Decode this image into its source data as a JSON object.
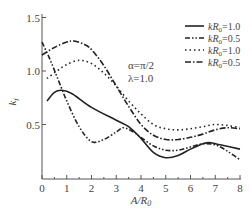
{
  "chart_data": {
    "type": "line",
    "title": "",
    "xlabel": "A/R0",
    "ylabel": "k_f^2",
    "xlim": [
      0,
      8
    ],
    "ylim": [
      0,
      1.5
    ],
    "x_ticks": [
      0,
      1,
      2,
      3,
      4,
      5,
      6,
      7,
      8
    ],
    "y_ticks": [
      0.5,
      1.0,
      1.5
    ],
    "y_tick_labels": [
      "0.5",
      "1.0",
      "1.5"
    ],
    "grid": false,
    "legend_position": "upper right",
    "annotations": [
      "α=π/2",
      "λ=1.0"
    ],
    "series": [
      {
        "name": "kR0=1.0",
        "style": "solid",
        "x": [
          0.2,
          0.5,
          0.8,
          1.2,
          2.0,
          3.0,
          3.5,
          4.0,
          4.5,
          5.0,
          5.5,
          6.0,
          6.5,
          6.8,
          7.2,
          8.0
        ],
        "y": [
          0.72,
          0.8,
          0.82,
          0.79,
          0.66,
          0.54,
          0.48,
          0.37,
          0.24,
          0.19,
          0.21,
          0.27,
          0.32,
          0.33,
          0.31,
          0.27
        ]
      },
      {
        "name": "kR0=0.5",
        "style": "dash-dot-dot",
        "x": [
          0.0,
          0.3,
          0.6,
          1.0,
          1.5,
          2.0,
          2.5,
          3.0,
          3.3,
          3.7,
          4.0,
          4.5,
          5.0,
          5.5,
          6.0,
          6.5,
          7.0,
          7.5,
          8.0
        ],
        "y": [
          1.27,
          1.12,
          0.95,
          0.72,
          0.48,
          0.34,
          0.36,
          0.43,
          0.47,
          0.43,
          0.38,
          0.3,
          0.26,
          0.26,
          0.29,
          0.32,
          0.31,
          0.25,
          0.17
        ]
      },
      {
        "name": "kR0=1.0",
        "style": "dotted",
        "x": [
          0.2,
          0.6,
          1.0,
          1.5,
          2.0,
          2.5,
          3.0,
          3.5,
          4.0,
          4.5,
          5.0,
          5.5,
          6.0,
          6.5,
          7.0,
          7.5,
          8.0
        ],
        "y": [
          0.93,
          1.0,
          1.06,
          1.1,
          1.07,
          0.98,
          0.86,
          0.72,
          0.6,
          0.5,
          0.46,
          0.45,
          0.46,
          0.48,
          0.5,
          0.49,
          0.47
        ]
      },
      {
        "name": "kR0=0.5",
        "style": "dash-dot",
        "x": [
          0.0,
          0.5,
          1.0,
          1.3,
          1.7,
          2.0,
          2.5,
          3.0,
          3.5,
          4.0,
          4.5,
          5.0,
          5.5,
          6.0,
          6.5,
          7.0,
          7.5,
          8.0
        ],
        "y": [
          1.15,
          1.22,
          1.27,
          1.28,
          1.25,
          1.2,
          1.05,
          0.86,
          0.67,
          0.5,
          0.4,
          0.36,
          0.36,
          0.38,
          0.41,
          0.45,
          0.47,
          0.46
        ]
      }
    ]
  },
  "legend": [
    {
      "label": "kR0=1.0",
      "style": "solid"
    },
    {
      "label": "kR0=0.5",
      "style": "dash-dot-dot"
    },
    {
      "label": "kR0=1.0",
      "style": "dotted"
    },
    {
      "label": "kR0=0.5",
      "style": "dash-dot"
    }
  ],
  "annotation": {
    "alpha": "α=π/2",
    "lambda": "λ=1.0"
  },
  "axes": {
    "xlabel": "A/R",
    "xlabel_sub": "0",
    "ylabel": "k",
    "ylabel_sub": "f",
    "ylabel_sup": "2"
  },
  "colors": {
    "line": "#222222",
    "axis": "#555555"
  }
}
